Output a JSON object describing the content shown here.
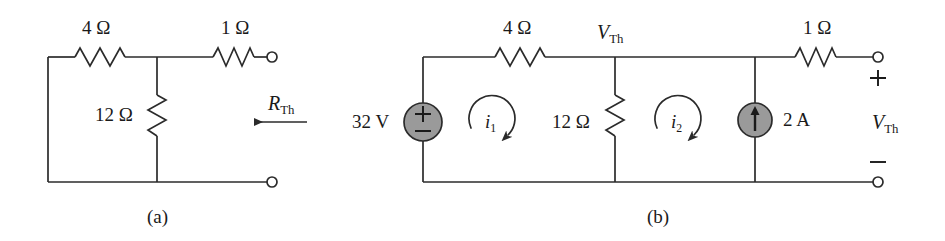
{
  "figure": {
    "type": "circuit-diagram",
    "panels": [
      {
        "id": "a",
        "caption": "(a)",
        "components": [
          {
            "name": "resistor-4-ohm-top",
            "label": "4 Ω",
            "orientation": "horizontal"
          },
          {
            "name": "resistor-1-ohm-top",
            "label": "1 Ω",
            "orientation": "horizontal"
          },
          {
            "name": "resistor-12-ohm-shunt",
            "label": "12 Ω",
            "orientation": "vertical"
          }
        ],
        "annotations": [
          {
            "name": "rth-label",
            "symbol": "R",
            "subscript": "Th",
            "arrow": "left"
          }
        ],
        "terminals": [
          {
            "name": "terminal-top",
            "position": "top-right"
          },
          {
            "name": "terminal-bottom",
            "position": "bottom-right"
          }
        ]
      },
      {
        "id": "b",
        "caption": "(b)",
        "components": [
          {
            "name": "voltage-source-32v",
            "label": "32 V",
            "plus": "+",
            "minus": "−",
            "type": "independent-voltage-source"
          },
          {
            "name": "resistor-4-ohm-top",
            "label": "4 Ω",
            "orientation": "horizontal"
          },
          {
            "name": "resistor-12-ohm-shunt",
            "label": "12 Ω",
            "orientation": "vertical"
          },
          {
            "name": "current-source-2a",
            "label": "2 A",
            "type": "independent-current-source",
            "direction": "up"
          },
          {
            "name": "resistor-1-ohm-top",
            "label": "1 Ω",
            "orientation": "horizontal"
          }
        ],
        "annotations": [
          {
            "name": "node-vth-label",
            "symbol": "V",
            "subscript": "Th"
          },
          {
            "name": "mesh-current-i1",
            "symbol": "i",
            "subscript": "1",
            "direction": "clockwise"
          },
          {
            "name": "mesh-current-i2",
            "symbol": "i",
            "subscript": "2",
            "direction": "clockwise"
          },
          {
            "name": "output-vth-label",
            "symbol": "V",
            "subscript": "Th"
          },
          {
            "name": "polarity-plus",
            "symbol": "+"
          },
          {
            "name": "polarity-minus",
            "symbol": "−"
          }
        ],
        "terminals": [
          {
            "name": "terminal-top",
            "position": "top-right"
          },
          {
            "name": "terminal-bottom",
            "position": "bottom-right"
          }
        ]
      }
    ],
    "labels": {
      "a_r4": "4 Ω",
      "a_r1": "1 Ω",
      "a_r12": "12 Ω",
      "a_rth_sym": "R",
      "a_rth_sub": "Th",
      "a_caption": "(a)",
      "b_v32": "32 V",
      "b_plus_src": "+",
      "b_minus_src": "−",
      "b_r4": "4 Ω",
      "b_vth_node_sym": "V",
      "b_vth_node_sub": "Th",
      "b_r12": "12 Ω",
      "b_i1_sym": "i",
      "b_i1_sub": "1",
      "b_i2_sym": "i",
      "b_i2_sub": "2",
      "b_i2a": "2 A",
      "b_r1": "1 Ω",
      "b_plus_out": "+",
      "b_minus_out": "−",
      "b_vth_out_sym": "V",
      "b_vth_out_sub": "Th",
      "b_caption": "(b)"
    },
    "colors": {
      "wire": "#2b2b2b",
      "source_fill": "#9a9a9a",
      "source_stroke": "#2b2b2b",
      "background": "#ffffff",
      "text": "#1a1a1a"
    }
  }
}
